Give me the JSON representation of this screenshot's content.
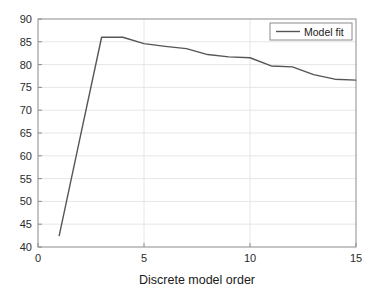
{
  "chart_data": {
    "type": "line",
    "title": "",
    "subtitle": "",
    "xlabel": "Discrete model order",
    "ylabel": "",
    "xlim": [
      0,
      15
    ],
    "ylim": [
      40,
      90
    ],
    "xticks": [
      0,
      5,
      10,
      15
    ],
    "xtick_labels": [
      "0",
      "5",
      "10",
      "15"
    ],
    "yticks": [
      40,
      45,
      50,
      55,
      60,
      65,
      70,
      75,
      80,
      85,
      90
    ],
    "ytick_labels": [
      "40",
      "45",
      "50",
      "55",
      "60",
      "65",
      "70",
      "75",
      "80",
      "85",
      "90"
    ],
    "grid": true,
    "grid_color": "#e6e6e6",
    "axis_color": "#8c8c8c",
    "background": "#ffffff",
    "legend": {
      "position": "top-right",
      "entries": [
        {
          "name": "Model fit",
          "color": "#555555",
          "style": "solid"
        }
      ]
    },
    "series": [
      {
        "name": "Model fit",
        "color": "#555555",
        "line_width": 1.4,
        "x": [
          1,
          2,
          3,
          4,
          5,
          6,
          7,
          8,
          9,
          10,
          11,
          12,
          13,
          14,
          15
        ],
        "values": [
          42.5,
          64.3,
          86.0,
          86.0,
          84.6,
          84.0,
          83.5,
          82.2,
          81.7,
          81.5,
          79.7,
          79.5,
          77.8,
          76.8,
          76.6
        ]
      }
    ]
  },
  "axes": {
    "x_axis_label": "Discrete model order",
    "y_axis_label": ""
  },
  "legend": {
    "model_fit_label": "Model fit"
  }
}
